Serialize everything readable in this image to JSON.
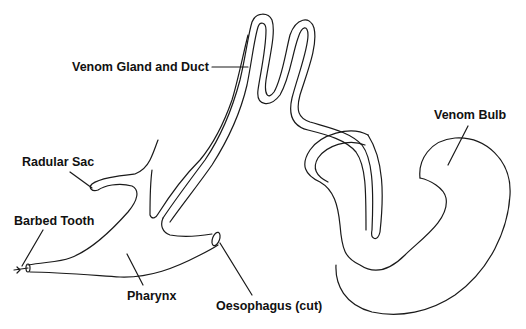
{
  "diagram": {
    "title": "",
    "labels": {
      "venom_gland": "Venom Gland and Duct",
      "venom_bulb": "Venom Bulb",
      "radular_sac": "Radular Sac",
      "barbed_tooth": "Barbed Tooth",
      "pharynx": "Pharynx",
      "oesophagus": "Oesophagus (cut)"
    },
    "colors": {
      "line": "#1a1a1a",
      "background": "#ffffff"
    }
  }
}
